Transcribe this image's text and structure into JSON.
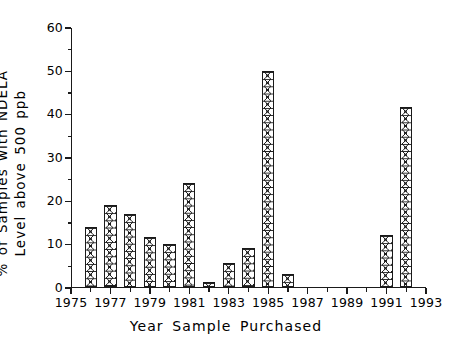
{
  "chart_data": {
    "type": "bar",
    "title": "",
    "subtitle": "",
    "xlabel": "Year Sample Purchased",
    "ylabel_line1": "% of Samples with NDELA",
    "ylabel_line2": "Level above 500 ppb",
    "xlim": [
      1975,
      1993
    ],
    "ylim": [
      0,
      60
    ],
    "x_major_ticks": [
      1975,
      1977,
      1979,
      1981,
      1983,
      1985,
      1987,
      1989,
      1991,
      1993
    ],
    "x_minor_ticks": [
      1976,
      1978,
      1980,
      1982,
      1984,
      1986,
      1988,
      1990,
      1992
    ],
    "x_tick_labels": [
      "1975",
      "1977",
      "1979",
      "1981",
      "1983",
      "1985",
      "1987",
      "1989",
      "1991",
      "1993"
    ],
    "y_major_ticks": [
      0,
      10,
      20,
      30,
      40,
      50,
      60
    ],
    "y_minor_ticks": [
      5,
      15,
      25,
      35,
      45,
      55
    ],
    "y_tick_labels": [
      "0",
      "10",
      "20",
      "30",
      "40",
      "50",
      "60"
    ],
    "grid": false,
    "legend": false,
    "bar_width_years": 0.62,
    "bar_fill": "crosshatch-x",
    "bar_edge_color": "#1a1a1a",
    "bar_face_color": "#ffffff",
    "axes_color": "#1a1a1a",
    "background_color": "#ffffff",
    "spines": [
      "left",
      "bottom"
    ],
    "x": [
      1976,
      1977,
      1978,
      1979,
      1980,
      1981,
      1982,
      1983,
      1984,
      1985,
      1986,
      1991,
      1992
    ],
    "categories": [
      "1976",
      "1977",
      "1978",
      "1979",
      "1980",
      "1981",
      "1982",
      "1983",
      "1984",
      "1985",
      "1986",
      "1991",
      "1992"
    ],
    "values": [
      13.7,
      18.8,
      16.7,
      11.5,
      9.8,
      23.9,
      1.0,
      5.5,
      9.0,
      49.8,
      2.8,
      12.0,
      41.5
    ]
  }
}
